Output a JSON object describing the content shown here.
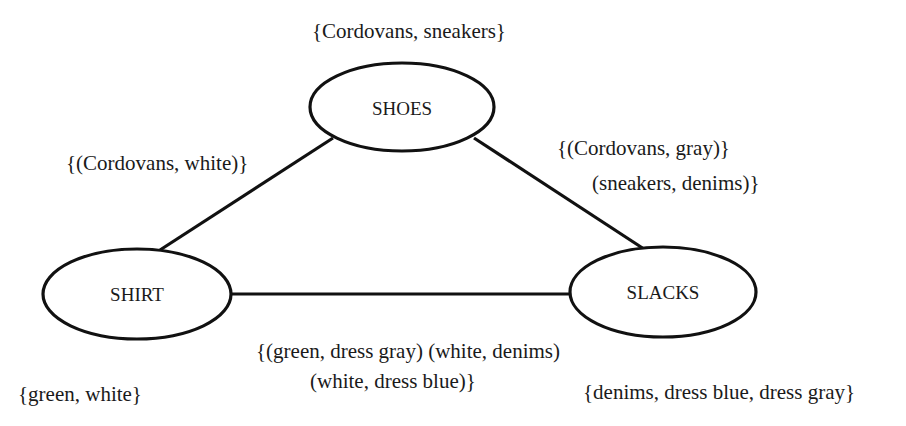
{
  "diagram": {
    "type": "constraint-graph",
    "nodes": [
      {
        "id": "shoes",
        "label": "SHOES",
        "domain_label": "{Cordovans, sneakers}"
      },
      {
        "id": "shirt",
        "label": "SHIRT",
        "domain_label": "{green, white}"
      },
      {
        "id": "slacks",
        "label": "SLACKS",
        "domain_label": "{denims, dress blue, dress gray}"
      }
    ],
    "edges": [
      {
        "from": "shirt",
        "to": "shoes",
        "constraint_lines": [
          "{(Cordovans, white)}"
        ]
      },
      {
        "from": "shoes",
        "to": "slacks",
        "constraint_lines": [
          "{(Cordovans, gray)}",
          "(sneakers, denims)}"
        ]
      },
      {
        "from": "shirt",
        "to": "slacks",
        "constraint_lines": [
          "{(green, dress gray) (white, denims)",
          "(white, dress blue)}"
        ]
      }
    ]
  }
}
